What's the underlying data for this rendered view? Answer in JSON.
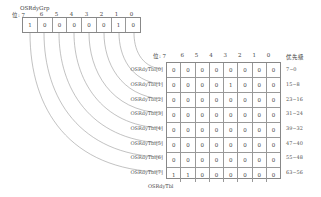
{
  "group": {
    "name": "OSRdyGrp",
    "bit_label_prefix": "位: 7",
    "bit_numbers": [
      "6",
      "5",
      "4",
      "3",
      "2",
      "1",
      "0"
    ],
    "values": [
      "1",
      "0",
      "0",
      "0",
      "0",
      "0",
      "1",
      "0"
    ]
  },
  "table": {
    "name": "OSRdyTbl",
    "bit_label_prefix": "位: 7",
    "bit_numbers": [
      "6",
      "5",
      "4",
      "3",
      "2",
      "1",
      "0"
    ],
    "priority_header": "优先级",
    "rows": [
      {
        "label": "OSRdyTbl[0]",
        "values": [
          "0",
          "0",
          "0",
          "0",
          "0",
          "0",
          "0",
          "0"
        ],
        "priority": "7~0"
      },
      {
        "label": "OSRdyTbl[1]",
        "values": [
          "0",
          "0",
          "0",
          "0",
          "1",
          "0",
          "0",
          "0"
        ],
        "priority": "15~8"
      },
      {
        "label": "OSRdyTbl[2]",
        "values": [
          "0",
          "0",
          "0",
          "0",
          "0",
          "0",
          "0",
          "0"
        ],
        "priority": "23~16"
      },
      {
        "label": "OSRdyTbl[3]",
        "values": [
          "0",
          "0",
          "0",
          "0",
          "0",
          "0",
          "0",
          "0"
        ],
        "priority": "31~24"
      },
      {
        "label": "OSRdyTbl[4]",
        "values": [
          "0",
          "0",
          "0",
          "0",
          "0",
          "0",
          "0",
          "0"
        ],
        "priority": "39~32"
      },
      {
        "label": "OSRdyTbl[5]",
        "values": [
          "0",
          "0",
          "0",
          "0",
          "0",
          "0",
          "0",
          "0"
        ],
        "priority": "47~40"
      },
      {
        "label": "OSRdyTbl[6]",
        "values": [
          "0",
          "0",
          "0",
          "0",
          "0",
          "0",
          "0",
          "0"
        ],
        "priority": "55~48"
      },
      {
        "label": "OSRdyTbl[7]",
        "values": [
          "1",
          "1",
          "0",
          "0",
          "0",
          "0",
          "0",
          "0"
        ],
        "priority": "63~56"
      }
    ]
  }
}
